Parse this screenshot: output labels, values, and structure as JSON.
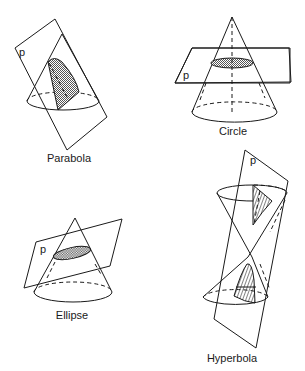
{
  "figure": {
    "panels": [
      {
        "id": "parabola",
        "caption": "Parabola",
        "plane_label": "p"
      },
      {
        "id": "circle",
        "caption": "Circle",
        "plane_label": "p"
      },
      {
        "id": "ellipse",
        "caption": "Ellipse",
        "plane_label": "p"
      },
      {
        "id": "hyperbola",
        "caption": "Hyperbola",
        "plane_label": "p"
      }
    ],
    "colors": {
      "line": "#1a1a1a",
      "background": "#ffffff",
      "hatch_fill": "#9a9a9a"
    }
  }
}
